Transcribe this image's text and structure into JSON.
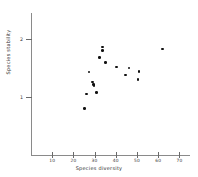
{
  "chart_data": {
    "type": "scatter",
    "title": "",
    "xlabel": "Species diversity",
    "ylabel": "Species stability",
    "xlim": [
      0,
      75
    ],
    "ylim": [
      0,
      2.45
    ],
    "xticks": [
      10,
      20,
      30,
      40,
      50,
      60,
      70
    ],
    "xtick_labels": [
      "10",
      "20",
      "30",
      "40",
      "50",
      "60",
      "70"
    ],
    "yticks": [
      1,
      2
    ],
    "ytick_labels": [
      "1",
      "2"
    ],
    "grid": false,
    "legend": null,
    "marker": "filled-circle",
    "marker_color": "#111111",
    "axis_color": "#8a8a8a",
    "background_color": "#ffffff",
    "n_points": 17,
    "points": [
      {
        "x": 25.2,
        "y": 0.8
      },
      {
        "x": 26.3,
        "y": 1.05
      },
      {
        "x": 27.4,
        "y": 1.43
      },
      {
        "x": 29.0,
        "y": 1.26
      },
      {
        "x": 29.4,
        "y": 1.22
      },
      {
        "x": 29.8,
        "y": 1.2
      },
      {
        "x": 30.8,
        "y": 1.08
      },
      {
        "x": 32.4,
        "y": 1.68
      },
      {
        "x": 33.6,
        "y": 1.86
      },
      {
        "x": 33.8,
        "y": 1.8
      },
      {
        "x": 35.2,
        "y": 1.6
      },
      {
        "x": 40.4,
        "y": 1.52
      },
      {
        "x": 44.6,
        "y": 1.38
      },
      {
        "x": 46.2,
        "y": 1.5
      },
      {
        "x": 50.4,
        "y": 1.3
      },
      {
        "x": 51.0,
        "y": 1.44
      },
      {
        "x": 62.0,
        "y": 1.83
      }
    ]
  }
}
